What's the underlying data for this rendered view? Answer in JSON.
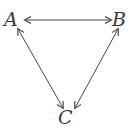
{
  "diagram": {
    "type": "triangle-relationship",
    "nodes": [
      {
        "id": "A",
        "label": "A"
      },
      {
        "id": "B",
        "label": "B"
      },
      {
        "id": "C",
        "label": "C"
      }
    ],
    "edges": [
      {
        "from": "A",
        "to": "B",
        "direction": "bidirectional"
      },
      {
        "from": "A",
        "to": "C",
        "direction": "bidirectional"
      },
      {
        "from": "B",
        "to": "C",
        "direction": "bidirectional"
      }
    ],
    "colors": {
      "stroke": "#4a4a4a",
      "text": "#3a3a3a",
      "background": "#ffffff"
    }
  }
}
